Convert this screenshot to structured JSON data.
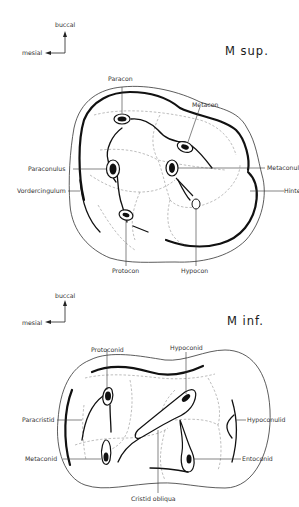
{
  "upper_molar": {
    "title": "M sup.",
    "orientation": {
      "vertical": "buccal",
      "horizontal": "mesial"
    },
    "labels": {
      "paracon": "Paracon",
      "metacon": "Metacon",
      "paraconulus": "Paraconulus",
      "metaconulus": "Metaconulus",
      "vordercingulum": "Vordercingulum",
      "hintercingulum": "Hintercingulum",
      "protocon": "Protocon",
      "hypocon": "Hypocon"
    }
  },
  "lower_molar": {
    "title": "M inf.",
    "orientation": {
      "vertical": "buccal",
      "horizontal": "mesial"
    },
    "labels": {
      "protoconid": "Protoconid",
      "hypoconid": "Hypoconid",
      "paracristid": "Paracristid",
      "hypoconulid": "Hypoconulid",
      "metaconid": "Metaconid",
      "entoconid": "Entoconid",
      "cristid_obliqua": "Cristid obliqua"
    }
  }
}
